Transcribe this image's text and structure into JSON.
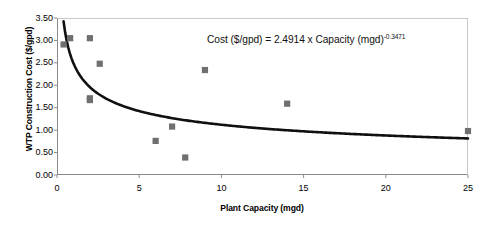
{
  "chart_data": {
    "type": "scatter",
    "title": "",
    "xlabel": "Plant Capacity (mgd)",
    "ylabel": "WTP Construction Cost ($/gpd)",
    "xlim": [
      0,
      25
    ],
    "ylim": [
      0,
      3.5
    ],
    "xticks": [
      0,
      5,
      10,
      15,
      20,
      25
    ],
    "xtick_labels": [
      "0",
      "5",
      "10",
      "15",
      "20",
      "25"
    ],
    "yticks": [
      0.0,
      0.5,
      1.0,
      1.5,
      2.0,
      2.5,
      3.0,
      3.5
    ],
    "ytick_labels": [
      "0.00",
      "0.50",
      "1.00",
      "1.50",
      "2.00",
      "2.50",
      "3.00",
      "3.50"
    ],
    "grid": false,
    "legend": false,
    "marker_color": "#6f6f6f",
    "marker_shape": "square",
    "trend_color": "#101010",
    "series": [
      {
        "name": "WTP construction cost observations",
        "points": [
          {
            "x": 0.4,
            "y": 2.91
          },
          {
            "x": 0.8,
            "y": 3.05
          },
          {
            "x": 2.0,
            "y": 3.05
          },
          {
            "x": 2.0,
            "y": 1.71
          },
          {
            "x": 2.0,
            "y": 1.67
          },
          {
            "x": 2.6,
            "y": 2.48
          },
          {
            "x": 6.0,
            "y": 0.76
          },
          {
            "x": 7.0,
            "y": 1.08
          },
          {
            "x": 7.8,
            "y": 0.39
          },
          {
            "x": 9.0,
            "y": 2.34
          },
          {
            "x": 14.0,
            "y": 1.59
          },
          {
            "x": 25.0,
            "y": 0.98
          }
        ]
      }
    ],
    "trend": {
      "type": "power",
      "coefficient": 2.4914,
      "exponent": -0.3471,
      "x_start": 0.4,
      "x_end": 25.0
    },
    "annotations": [
      {
        "name": "regression-equation",
        "prefix": "Cost ($/gpd) = 2.4914 x Capacity (mgd)",
        "exponent": "-0.3471"
      }
    ]
  },
  "axes": {
    "x_title": "Plant Capacity (mgd)",
    "y_title": "WTP Construction Cost ($/gpd)"
  }
}
